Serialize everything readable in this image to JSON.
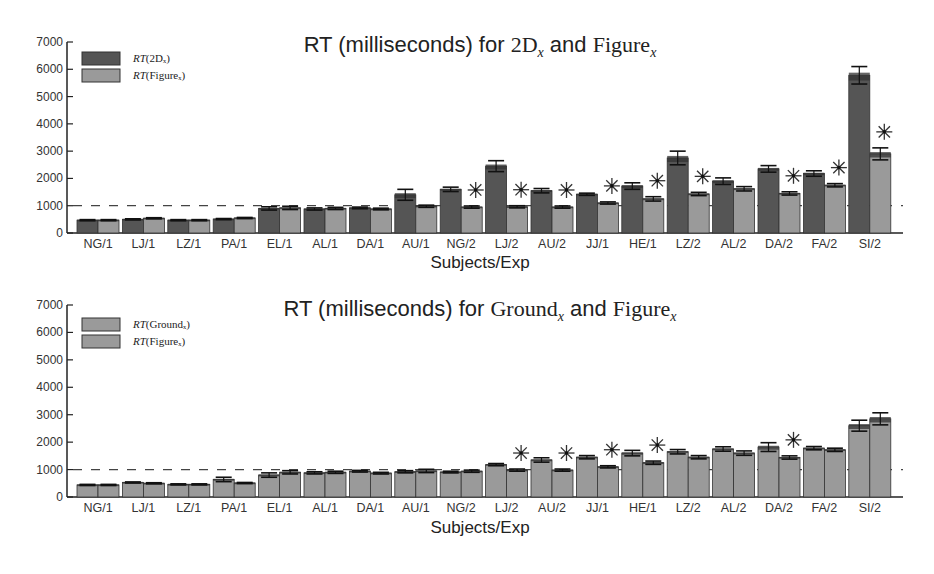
{
  "chart_data": [
    {
      "type": "bar",
      "title": "RT (milliseconds) for 2D_x and Figure_x",
      "title_parts": {
        "prefix": "RT (milliseconds) for ",
        "a": "2D",
        "a_sub": "x",
        "mid": " and ",
        "b": "Figure",
        "b_sub": "x"
      },
      "xlabel": "Subjects/Exp",
      "ylabel": "",
      "ylim": [
        0,
        7000
      ],
      "yticks": [
        0,
        1000,
        2000,
        3000,
        4000,
        5000,
        6000,
        7000
      ],
      "reference_line": 1000,
      "grid": false,
      "legend_position": "upper left",
      "categories": [
        "NG/1",
        "LJ/1",
        "LZ/1",
        "PA/1",
        "EL/1",
        "AL/1",
        "DA/1",
        "AU/1",
        "NG/2",
        "LJ/2",
        "AU/2",
        "JJ/1",
        "HE/1",
        "LZ/2",
        "AL/2",
        "DA/2",
        "FA/2",
        "SI/2"
      ],
      "series": [
        {
          "name": "RT(2D_x)",
          "legend_label": "RT(2Dₓ)",
          "color": "#555555",
          "values": [
            470,
            500,
            470,
            510,
            900,
            880,
            920,
            1400,
            1600,
            2450,
            1550,
            1420,
            1720,
            2750,
            1900,
            2350,
            2180,
            5780
          ],
          "errors": [
            20,
            20,
            20,
            20,
            60,
            40,
            30,
            200,
            80,
            200,
            80,
            40,
            120,
            250,
            120,
            120,
            100,
            320
          ]
        },
        {
          "name": "RT(Figure_x)",
          "legend_label": "RT(Figureₓ)",
          "color": "#9a9a9a",
          "values": [
            470,
            540,
            470,
            550,
            920,
            900,
            880,
            980,
            950,
            960,
            950,
            1100,
            1250,
            1430,
            1620,
            1450,
            1750,
            2900
          ],
          "errors": [
            20,
            20,
            20,
            20,
            60,
            40,
            30,
            40,
            40,
            40,
            40,
            40,
            80,
            60,
            80,
            60,
            60,
            220
          ]
        }
      ],
      "significant": [
        "NG/2",
        "LJ/2",
        "AU/2",
        "JJ/1",
        "HE/1",
        "LZ/2",
        "DA/2",
        "FA/2",
        "SI/2"
      ],
      "significance_marker": "✳"
    },
    {
      "type": "bar",
      "title": "RT (milliseconds) for Ground_x and Figure_x",
      "title_parts": {
        "prefix": "RT (milliseconds) for ",
        "a": "Ground",
        "a_sub": "x",
        "mid": " and ",
        "b": "Figure",
        "b_sub": "x"
      },
      "xlabel": "Subjects/Exp",
      "ylabel": "",
      "ylim": [
        0,
        7000
      ],
      "yticks": [
        0,
        1000,
        2000,
        3000,
        4000,
        5000,
        6000,
        7000
      ],
      "reference_line": 1000,
      "grid": false,
      "legend_position": "upper left",
      "categories": [
        "NG/1",
        "LJ/1",
        "LZ/1",
        "PA/1",
        "EL/1",
        "AL/1",
        "DA/1",
        "AU/1",
        "NG/2",
        "LJ/2",
        "AU/2",
        "JJ/1",
        "HE/1",
        "LZ/2",
        "AL/2",
        "DA/2",
        "FA/2",
        "SI/2"
      ],
      "series": [
        {
          "name": "RT(Ground_x)",
          "legend_label": "RT(Groundₓ)",
          "color": "#9a9a9a",
          "values": [
            440,
            530,
            460,
            640,
            800,
            880,
            940,
            920,
            910,
            1180,
            1350,
            1450,
            1600,
            1650,
            1750,
            1820,
            1780,
            2600
          ],
          "errors": [
            20,
            20,
            20,
            80,
            80,
            40,
            30,
            40,
            30,
            40,
            80,
            60,
            100,
            80,
            80,
            160,
            60,
            200
          ]
        },
        {
          "name": "RT(Figure_x)",
          "legend_label": "RT(Figureₓ)",
          "color": "#9a9a9a",
          "values": [
            440,
            500,
            460,
            510,
            900,
            900,
            870,
            950,
            940,
            980,
            980,
            1100,
            1250,
            1450,
            1600,
            1440,
            1720,
            2850
          ],
          "errors": [
            20,
            20,
            20,
            20,
            60,
            40,
            30,
            60,
            40,
            40,
            40,
            40,
            60,
            60,
            80,
            60,
            60,
            220
          ]
        }
      ],
      "significant": [
        "LJ/2",
        "AU/2",
        "JJ/1",
        "HE/1",
        "DA/2"
      ],
      "significance_marker": "✳"
    }
  ]
}
